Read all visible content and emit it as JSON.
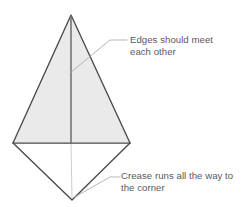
{
  "figure": {
    "name": "origami-kite-fold-diagram",
    "canvas": {
      "width": 250,
      "height": 207,
      "background": "#ffffff"
    }
  },
  "annotations": [
    {
      "id": "edges-meet",
      "line1": "Edges should meet",
      "line2": "each other",
      "text_color": "#5a5a5c"
    },
    {
      "id": "crease-corner",
      "line1": "Crease runs all the way to",
      "line2": "the corner",
      "text_color": "#5a5a5c"
    }
  ],
  "shape": {
    "apex": {
      "x": 71,
      "y": 15
    },
    "left_vertex": {
      "x": 13,
      "y": 143
    },
    "right_vertex": {
      "x": 130,
      "y": 143
    },
    "bottom_vertex": {
      "x": 72,
      "y": 200
    },
    "crease_top": {
      "x": 71,
      "y": 15
    },
    "crease_middle": {
      "x": 71,
      "y": 143
    },
    "crease_bottom": {
      "x": 72,
      "y": 200
    },
    "fill_upper": "#eaeaea",
    "fill_lower": "#ffffff",
    "outline_color": "#4a4a4a",
    "outline_width": 1.3,
    "crease_color": "#6e6e70",
    "faint_crease_color": "#c8c8c8"
  },
  "leaders": [
    {
      "id": "leader-edges-meet",
      "color": "#a9a9ab",
      "from": {
        "x": 127,
        "y": 40
      },
      "elbow": {
        "x": 110,
        "y": 40
      },
      "to": {
        "x": 70,
        "y": 73
      }
    },
    {
      "id": "leader-crease-corner",
      "color": "#a9a9ab",
      "from": {
        "x": 120,
        "y": 177
      },
      "elbow": {
        "x": 110,
        "y": 177
      },
      "to": {
        "x": 73,
        "y": 198
      }
    }
  ]
}
